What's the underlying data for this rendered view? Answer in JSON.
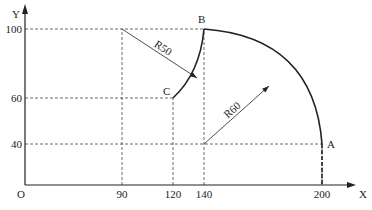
{
  "diagram": {
    "type": "cnc-arc-toolpath",
    "axes": {
      "x_label": "X",
      "y_label": "Y",
      "origin_label": "O",
      "x_ticks": [
        90,
        120,
        140,
        200
      ],
      "y_ticks": [
        40,
        60,
        100
      ]
    },
    "points": [
      {
        "name": "A",
        "x": 200,
        "y": 40
      },
      {
        "name": "B",
        "x": 140,
        "y": 100
      },
      {
        "name": "C",
        "x": 120,
        "y": 60
      }
    ],
    "arcs": [
      {
        "from": "A",
        "to": "B",
        "center": [
          140,
          40
        ],
        "radius": 60,
        "label": "R60"
      },
      {
        "from": "B",
        "to": "C",
        "center": [
          90,
          100
        ],
        "radius": 50,
        "label": "R50"
      }
    ],
    "guides": [
      {
        "from": [
          0,
          100
        ],
        "to": [
          140,
          100
        ]
      },
      {
        "from": [
          0,
          60
        ],
        "to": [
          120,
          60
        ]
      },
      {
        "from": [
          0,
          40
        ],
        "to": [
          200,
          40
        ]
      },
      {
        "from": [
          90,
          0
        ],
        "to": [
          90,
          100
        ]
      },
      {
        "from": [
          120,
          0
        ],
        "to": [
          120,
          60
        ]
      },
      {
        "from": [
          140,
          0
        ],
        "to": [
          140,
          100
        ]
      },
      {
        "from": [
          200,
          0
        ],
        "to": [
          200,
          40
        ]
      }
    ],
    "colors": {
      "line": "#222222",
      "guide": "#444444"
    }
  }
}
